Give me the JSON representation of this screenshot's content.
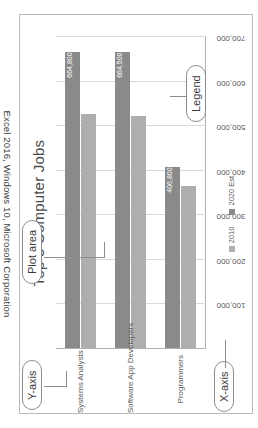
{
  "caption": "Excel 2016, Windows 10, Microsoft Corporation",
  "chart_data": {
    "type": "bar",
    "orientation": "vertical",
    "title": "Top 3 Computer Jobs",
    "xlabel": "",
    "ylabel": "",
    "categories": [
      "Systems Analysts",
      "Software App Developers",
      "Programmers"
    ],
    "series": [
      {
        "name": "2010",
        "color": "#aeaeae",
        "values": [
          524600,
          520800,
          363100
        ]
      },
      {
        "name": "2020 Est.",
        "color": "#8a8a8a",
        "values": [
          664800,
          664500,
          406800
        ]
      }
    ],
    "data_labels": [
      "664,800",
      "664,500",
      "406,800"
    ],
    "ylim": [
      0,
      700000
    ],
    "yticks": [
      100000,
      200000,
      300000,
      400000,
      500000,
      600000,
      700000
    ],
    "ytick_labels": [
      "100,000",
      "200,000",
      "300,000",
      "400,000",
      "500,000",
      "600,000",
      "700,000"
    ],
    "grid": true,
    "legend_position": "bottom"
  },
  "annotations": {
    "y_axis": "Y-axis",
    "x_axis": "X-axis",
    "plot_area": "Plot area",
    "legend": "Legend"
  }
}
